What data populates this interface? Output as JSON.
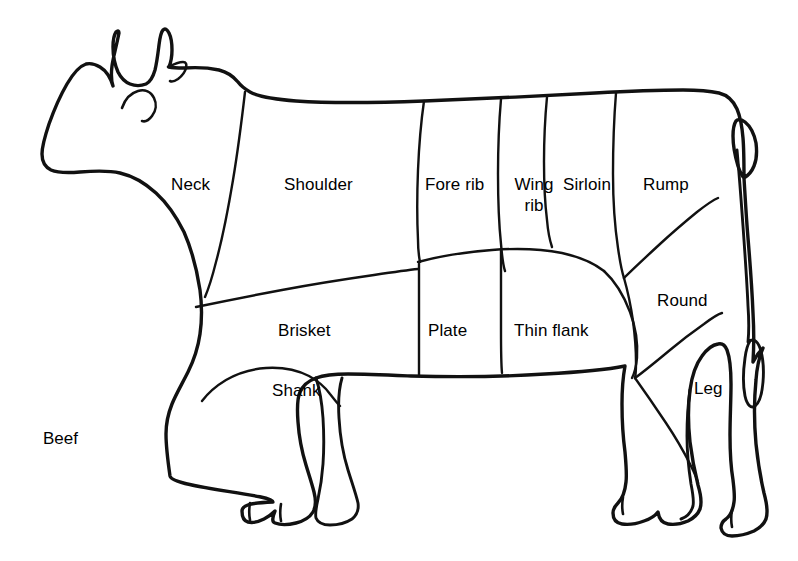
{
  "figure": {
    "title": "Beef",
    "background_color": "#ffffff",
    "line_color": "#111111"
  },
  "caption": {
    "text": "Beef",
    "x": 43,
    "y": 429
  },
  "cuts": [
    {
      "id": "neck",
      "label": "Neck",
      "x": 171,
      "y": 175
    },
    {
      "id": "shoulder",
      "label": "Shoulder",
      "x": 284,
      "y": 175
    },
    {
      "id": "fore-rib",
      "label": "Fore rib",
      "x": 425,
      "y": 175
    },
    {
      "id": "wing-rib",
      "label": "Wing\nrib",
      "x": 511,
      "y": 175
    },
    {
      "id": "sirloin",
      "label": "Sirloin",
      "x": 563,
      "y": 175
    },
    {
      "id": "rump",
      "label": "Rump",
      "x": 643,
      "y": 175
    },
    {
      "id": "round",
      "label": "Round",
      "x": 657,
      "y": 291
    },
    {
      "id": "leg",
      "label": "Leg",
      "x": 694,
      "y": 379
    },
    {
      "id": "brisket",
      "label": "Brisket",
      "x": 278,
      "y": 321
    },
    {
      "id": "plate",
      "label": "Plate",
      "x": 428,
      "y": 321
    },
    {
      "id": "thin-flank",
      "label": "Thin flank",
      "x": 514,
      "y": 321
    },
    {
      "id": "shank",
      "label": "Shank",
      "x": 272,
      "y": 381
    }
  ],
  "wing_rib_lines": {
    "line1": "Wing",
    "line2": "rib"
  }
}
